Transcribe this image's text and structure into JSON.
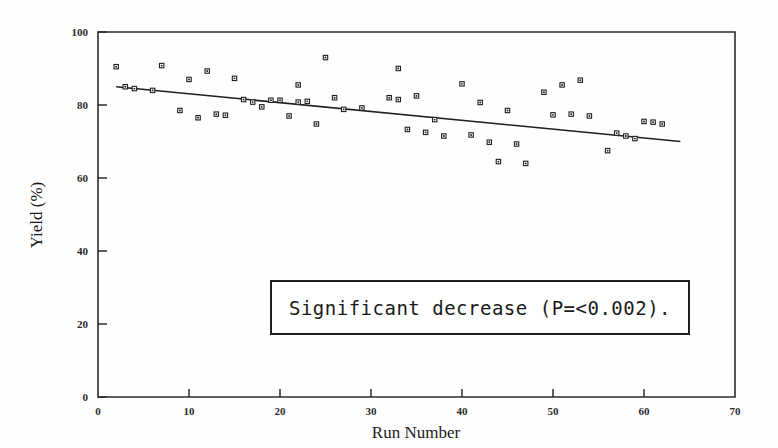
{
  "chart_data": {
    "type": "scatter",
    "title": "",
    "xlabel": "Run Number",
    "ylabel": "Yield (%)",
    "xlim": [
      0,
      70
    ],
    "ylim": [
      0,
      100
    ],
    "xticks": [
      0,
      10,
      20,
      30,
      40,
      50,
      60,
      70
    ],
    "yticks": [
      0,
      20,
      40,
      60,
      80,
      100
    ],
    "grid": false,
    "legend": null,
    "marker_style": "open-square-with-dot",
    "points": [
      {
        "x": 2,
        "y": 90.5
      },
      {
        "x": 3,
        "y": 85.0
      },
      {
        "x": 4,
        "y": 84.5
      },
      {
        "x": 6,
        "y": 84.0
      },
      {
        "x": 7,
        "y": 90.8
      },
      {
        "x": 9,
        "y": 78.5
      },
      {
        "x": 10,
        "y": 87.0
      },
      {
        "x": 11,
        "y": 76.5
      },
      {
        "x": 12,
        "y": 89.3
      },
      {
        "x": 13,
        "y": 77.5
      },
      {
        "x": 14,
        "y": 77.2
      },
      {
        "x": 15,
        "y": 87.3
      },
      {
        "x": 16,
        "y": 81.5
      },
      {
        "x": 17,
        "y": 80.8
      },
      {
        "x": 18,
        "y": 79.5
      },
      {
        "x": 19,
        "y": 81.3
      },
      {
        "x": 20,
        "y": 81.3
      },
      {
        "x": 21,
        "y": 77.0
      },
      {
        "x": 22,
        "y": 80.8
      },
      {
        "x": 22,
        "y": 85.5
      },
      {
        "x": 23,
        "y": 81.0
      },
      {
        "x": 24,
        "y": 74.8
      },
      {
        "x": 25,
        "y": 93.0
      },
      {
        "x": 26,
        "y": 82.0
      },
      {
        "x": 27,
        "y": 78.8
      },
      {
        "x": 29,
        "y": 79.2
      },
      {
        "x": 32,
        "y": 82.0
      },
      {
        "x": 33,
        "y": 90.0
      },
      {
        "x": 33,
        "y": 81.5
      },
      {
        "x": 34,
        "y": 73.3
      },
      {
        "x": 35,
        "y": 82.5
      },
      {
        "x": 36,
        "y": 72.5
      },
      {
        "x": 37,
        "y": 76.0
      },
      {
        "x": 38,
        "y": 71.5
      },
      {
        "x": 40,
        "y": 85.8
      },
      {
        "x": 41,
        "y": 71.8
      },
      {
        "x": 42,
        "y": 80.7
      },
      {
        "x": 43,
        "y": 69.8
      },
      {
        "x": 44,
        "y": 64.5
      },
      {
        "x": 45,
        "y": 78.5
      },
      {
        "x": 46,
        "y": 69.3
      },
      {
        "x": 47,
        "y": 64.0
      },
      {
        "x": 49,
        "y": 83.5
      },
      {
        "x": 50,
        "y": 77.3
      },
      {
        "x": 51,
        "y": 85.5
      },
      {
        "x": 52,
        "y": 77.5
      },
      {
        "x": 53,
        "y": 86.8
      },
      {
        "x": 54,
        "y": 77.0
      },
      {
        "x": 56,
        "y": 67.5
      },
      {
        "x": 57,
        "y": 72.3
      },
      {
        "x": 58,
        "y": 71.5
      },
      {
        "x": 59,
        "y": 70.8
      },
      {
        "x": 60,
        "y": 75.5
      },
      {
        "x": 61,
        "y": 75.3
      },
      {
        "x": 62,
        "y": 74.8
      }
    ],
    "trend_line": {
      "x_start": 2,
      "y_start": 85.0,
      "x_end": 64,
      "y_end": 70.0,
      "style": "solid"
    },
    "annotation": {
      "text": "Significant decrease (P=<0.002).",
      "boxed": true
    }
  },
  "axes": {
    "x_label": "Run Number",
    "y_label": "Yield (%)",
    "x_tick_labels": [
      "0",
      "10",
      "20",
      "30",
      "40",
      "50",
      "60",
      "70"
    ],
    "y_tick_labels": [
      "0",
      "20",
      "40",
      "60",
      "80",
      "100"
    ]
  },
  "annotation": {
    "text": "Significant decrease (P=<0.002)."
  },
  "colors": {
    "axis": "#2b2b2b",
    "marker_stroke": "#1f1f1f",
    "marker_fill": "#ffffff",
    "trend": "#1f1f1f",
    "background": "#fefefe",
    "annotation_border": "#1f1f1f"
  }
}
